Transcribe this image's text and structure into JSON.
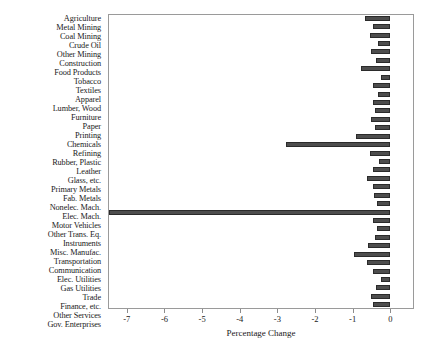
{
  "chart_data": {
    "type": "bar",
    "orientation": "horizontal",
    "title": "",
    "subtitle": "",
    "xlabel": "Percentage Change",
    "ylabel": "",
    "xlim": [
      -7.5,
      0.63
    ],
    "ylim": null,
    "grid": false,
    "legend": null,
    "legend_position": "none",
    "xticks": [
      -7,
      -6,
      -5,
      -4,
      -3,
      -2,
      -1,
      0
    ],
    "xticklabels": [
      "-7",
      "-6",
      "-5",
      "-4",
      "-3",
      "-2",
      "-1",
      "0"
    ],
    "bar_color": "#4d4d4d",
    "bar_edge_color": "#2b2b2b",
    "frame_color": "#9a9a9a",
    "background": "#ffffff",
    "categories": [
      "Agriculture",
      "Metal Mining",
      "Coal Mining",
      "Crude Oil",
      "Other Mining",
      "Construction",
      "Food Products",
      "Tobacco",
      "Textiles",
      "Apparel",
      "Lumber, Wood",
      "Furniture",
      "Paper",
      "Printing",
      "Chemicals",
      "Refining",
      "Rubber, Plastic",
      "Leather",
      "Glass, etc.",
      "Primary Metals",
      "Fab. Metals",
      "Nonelec. Mach.",
      "Elec. Mach.",
      "Motor Vehicles",
      "Other Trans. Eq.",
      "Instruments",
      "Misc. Manufac.",
      "Transportation",
      "Communication",
      "Elec. Utilities",
      "Gas Utilities",
      "Trade",
      "Finance, etc.",
      "Other Services",
      "Gov. Enterprises"
    ],
    "values": [
      -0.66,
      -0.47,
      -0.53,
      -0.32,
      -0.5,
      -0.37,
      -0.79,
      -0.24,
      -0.47,
      -0.32,
      -0.45,
      -0.4,
      -0.5,
      -0.4,
      -0.92,
      -2.76,
      -0.55,
      -0.29,
      -0.45,
      -0.63,
      -0.45,
      -0.42,
      -0.34,
      -7.48,
      -0.45,
      -0.34,
      -0.4,
      -0.58,
      -0.97,
      -0.63,
      -0.45,
      -0.26,
      -0.37,
      -0.5,
      -0.45
    ]
  }
}
